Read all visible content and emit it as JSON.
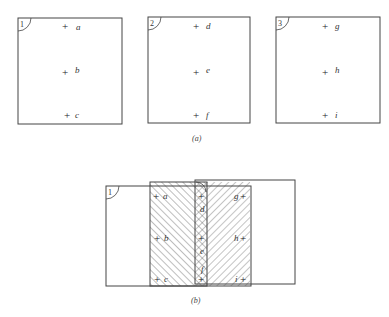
{
  "figure_a": {
    "caption": "(a)",
    "boxes": [
      {
        "number": "1",
        "x": 18,
        "y": 18,
        "w": 104,
        "h": 106,
        "points": [
          {
            "label": "a",
            "x": 68,
            "y": 27
          },
          {
            "label": "b",
            "x": 68,
            "y": 73
          },
          {
            "label": "c",
            "x": 70,
            "y": 115
          }
        ]
      },
      {
        "number": "2",
        "x": 148,
        "y": 17,
        "w": 102,
        "h": 106,
        "points": [
          {
            "label": "d",
            "x": 198,
            "y": 26
          },
          {
            "label": "e",
            "x": 198,
            "y": 73
          },
          {
            "label": "f",
            "x": 198,
            "y": 115
          }
        ]
      },
      {
        "number": "3",
        "x": 276,
        "y": 17,
        "w": 104,
        "h": 106,
        "points": [
          {
            "label": "g",
            "x": 327,
            "y": 26
          },
          {
            "label": "h",
            "x": 327,
            "y": 72
          },
          {
            "label": "i",
            "x": 327,
            "y": 115
          }
        ]
      }
    ]
  },
  "figure_b": {
    "caption": "(b)",
    "boxes": [
      {
        "number": "1",
        "x": 106,
        "y": 186,
        "w": 145,
        "h": 76
      },
      {
        "number": "2",
        "x": 150,
        "y": 182,
        "w": 57,
        "h": 80,
        "hatch": "backslash"
      },
      {
        "number": "3",
        "x": 195,
        "y": 180,
        "w": 100,
        "h": 92,
        "hatch": "slash",
        "hatch_width": 55
      }
    ],
    "points": [
      {
        "label": "a",
        "x": 158,
        "y": 197
      },
      {
        "label": "b",
        "x": 159,
        "y": 239
      },
      {
        "label": "c",
        "x": 159,
        "y": 280
      },
      {
        "label": "d",
        "x": 203,
        "y": 197
      },
      {
        "label": "e",
        "x": 203,
        "y": 239
      },
      {
        "label": "f",
        "x": 203,
        "y": 280
      },
      {
        "label": "g",
        "x": 243,
        "y": 197
      },
      {
        "label": "h",
        "x": 243,
        "y": 239
      },
      {
        "label": "i",
        "x": 243,
        "y": 280
      }
    ]
  }
}
